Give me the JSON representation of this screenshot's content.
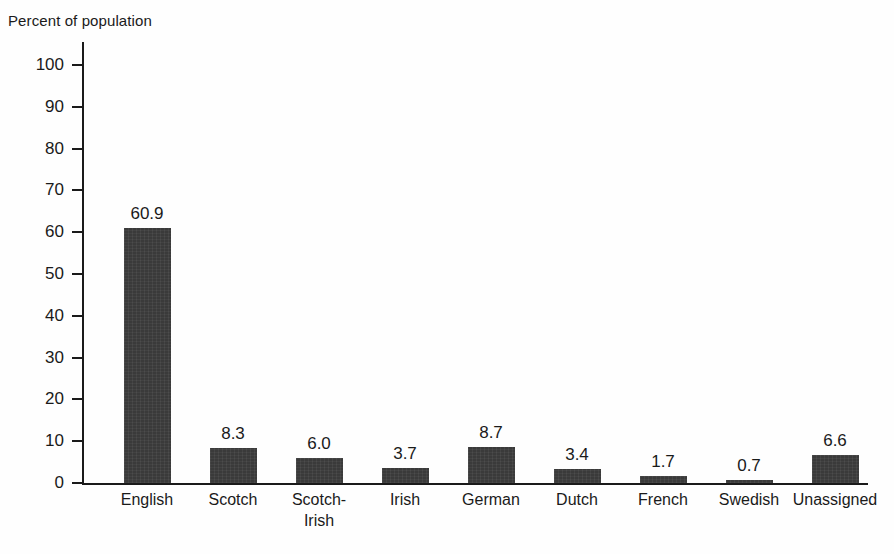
{
  "chart_data": {
    "type": "bar",
    "title": "Percent of population",
    "xlabel": "",
    "ylabel": "Percent of population",
    "ylim": [
      0,
      100
    ],
    "ytick_step": 10,
    "yticks": [
      "100",
      "90",
      "80",
      "70",
      "60",
      "50",
      "40",
      "30",
      "20",
      "10",
      "0"
    ],
    "grid": false,
    "legend": "none",
    "bar_color": "#3a3a3a",
    "axis_color": "#1a1a1a",
    "categories": [
      "English",
      "Scotch",
      "Scotch-\nIrish",
      "Irish",
      "German",
      "Dutch",
      "French",
      "Swedish",
      "Unassigned"
    ],
    "values": [
      60.9,
      8.3,
      6.0,
      3.7,
      8.7,
      3.4,
      1.7,
      0.7,
      6.6
    ],
    "value_labels": [
      "60.9",
      "8.3",
      "6.0",
      "3.7",
      "8.7",
      "3.4",
      "1.7",
      "0.7",
      "6.6"
    ]
  }
}
